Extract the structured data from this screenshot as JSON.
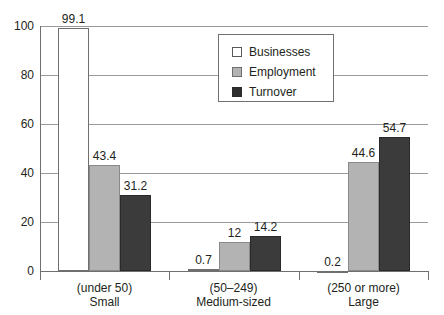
{
  "chart_data": {
    "type": "bar",
    "title": "",
    "subtitle": "",
    "xlabel": "",
    "ylabel": "",
    "ylim": [
      0,
      100
    ],
    "yticks": [
      "0",
      "20",
      "40",
      "60",
      "80",
      "100"
    ],
    "grid": true,
    "legend_position": "top-center",
    "categories": [
      {
        "line1": "(under 50)",
        "line2": "Small"
      },
      {
        "line1": "(50–249)",
        "line2": "Medium-sized"
      },
      {
        "line1": "(250 or more)",
        "line2": "Large"
      }
    ],
    "series": [
      {
        "name": "Businesses",
        "color": "#ffffff",
        "values": [
          99.1,
          0.7,
          0.2
        ],
        "labels": [
          "99.1",
          "0.7",
          "0.2"
        ]
      },
      {
        "name": "Employment",
        "color": "#b3b3b3",
        "values": [
          43.4,
          12,
          44.6
        ],
        "labels": [
          "43.4",
          "12",
          "44.6"
        ]
      },
      {
        "name": "Turnover",
        "color": "#3b3b3b",
        "values": [
          31.2,
          14.2,
          54.7
        ],
        "labels": [
          "31.2",
          "14.2",
          "54.7"
        ]
      }
    ]
  },
  "legend": {
    "items": [
      {
        "label": "Businesses",
        "swatch": "businesses"
      },
      {
        "label": "Employment",
        "swatch": "employment"
      },
      {
        "label": "Turnover",
        "swatch": "turnover"
      }
    ]
  },
  "colors": {
    "businesses": "#ffffff",
    "employment": "#b3b3b3",
    "turnover": "#3b3b3b",
    "axis": "#6f6f6f",
    "grid": "#9a9a9a",
    "text": "#231f20"
  }
}
